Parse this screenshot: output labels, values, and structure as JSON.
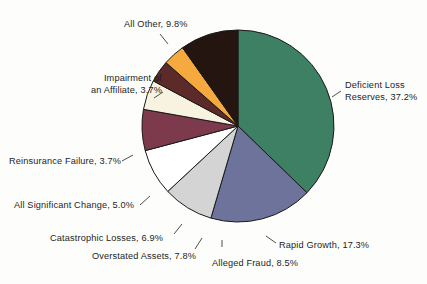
{
  "chart_data": {
    "type": "pie",
    "title": "",
    "subtitle": "",
    "legend_position": "callout-labels",
    "start_angle_deg": 0,
    "direction": "clockwise",
    "units": "percent",
    "total": 100.0,
    "categories": [
      "Deficient Loss Reserves",
      "Rapid Growth",
      "Alleged Fraud",
      "Overstated Assets",
      "Catastrophic Losses",
      "All Significant Change",
      "Reinsurance Failure",
      "Impairment of an Affiliate",
      "All Other"
    ],
    "values": [
      37.2,
      17.3,
      8.5,
      7.8,
      6.9,
      5.0,
      3.7,
      3.7,
      9.8
    ],
    "colors": [
      "#3d8063",
      "#6e739b",
      "#d4d4d4",
      "#ffffff",
      "#7d3a4c",
      "#f7f3e0",
      "#5c2b29",
      "#f5a93f",
      "#241510"
    ],
    "slices": [
      {
        "label": "Deficient Loss Reserves",
        "value": 37.2,
        "color": "#3d8063"
      },
      {
        "label": "Rapid Growth",
        "value": 17.3,
        "color": "#6e739b"
      },
      {
        "label": "Alleged Fraud",
        "value": 8.5,
        "color": "#d4d4d4"
      },
      {
        "label": "Overstated Assets",
        "value": 7.8,
        "color": "#ffffff"
      },
      {
        "label": "Catastrophic Losses",
        "value": 6.9,
        "color": "#7d3a4c"
      },
      {
        "label": "All Significant Change",
        "value": 5.0,
        "color": "#f7f3e0"
      },
      {
        "label": "Reinsurance Failure",
        "value": 3.7,
        "color": "#5c2b29"
      },
      {
        "label": "Impairment of an Affiliate",
        "value": 3.7,
        "color": "#f5a93f"
      },
      {
        "label": "All Other",
        "value": 9.8,
        "color": "#241510"
      }
    ]
  },
  "labels": {
    "deficient_line1": "Deficient Loss",
    "deficient_line2": "Reserves, 37.2%",
    "all_other": "All Other, 9.8%",
    "impairment_line1": "Impairment of",
    "impairment_line2": "an Affiliate, 3.7%",
    "reinsurance": "Reinsurance Failure, 3.7%",
    "all_significant": "All Significant Change, 5.0%",
    "catastrophic": "Catastrophic Losses, 6.9%",
    "overstated": "Overstated Assets, 7.8%",
    "alleged_fraud": "Alleged Fraud, 8.5%",
    "rapid_growth": "Rapid Growth, 17.3%"
  },
  "style": {
    "background": "#fdfdfc",
    "text_color": "#1d1d1d",
    "outline_color": "#1a1a1a",
    "leader_color": "#3a3a3a"
  }
}
